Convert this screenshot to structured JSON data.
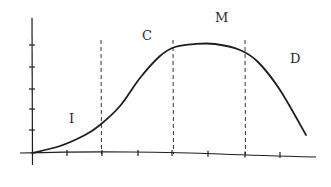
{
  "diagram": {
    "type": "lifecycle-curve",
    "phases": [
      {
        "id": "I",
        "label": "I",
        "x": 69,
        "y": 112
      },
      {
        "id": "C",
        "label": "C",
        "x": 142,
        "y": 29
      },
      {
        "id": "M",
        "label": "M",
        "x": 215,
        "y": 11
      },
      {
        "id": "D",
        "label": "D",
        "x": 290,
        "y": 52
      }
    ],
    "phase_boundaries_x": [
      101,
      173,
      245
    ],
    "y_axis": {
      "x": 32,
      "y_top": 18,
      "y_bottom": 165,
      "ticks_y": [
        45,
        67,
        89,
        109,
        130
      ]
    },
    "x_axis": {
      "y": 153,
      "x_start": 20,
      "x_end": 316,
      "ticks_x": [
        67,
        102,
        138,
        172,
        208,
        245,
        280
      ]
    },
    "curve_points": [
      [
        32,
        153
      ],
      [
        60,
        146
      ],
      [
        85,
        135
      ],
      [
        100,
        125
      ],
      [
        120,
        106
      ],
      [
        140,
        78
      ],
      [
        160,
        56
      ],
      [
        175,
        47
      ],
      [
        195,
        44
      ],
      [
        215,
        44
      ],
      [
        240,
        50
      ],
      [
        258,
        62
      ],
      [
        280,
        90
      ],
      [
        306,
        135
      ]
    ],
    "colors": {
      "ink": "#1e1e1e",
      "background": "#ffffff"
    }
  }
}
